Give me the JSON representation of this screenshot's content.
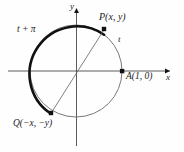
{
  "figure": {
    "background_color": "#fefefe",
    "stroke_color": "#111111",
    "thin_stroke_color": "#6a6a6a",
    "axis_color": "#4a4a4a"
  },
  "axes": {
    "x_label": "x",
    "y_label": "y",
    "origin": {
      "x": 76,
      "y": 71
    },
    "x_range_px": [
      8,
      172
    ],
    "y_range_px": [
      8,
      146
    ]
  },
  "circle": {
    "center": {
      "x": 76,
      "y": 71
    },
    "radius": 46,
    "label": "unit circle"
  },
  "points": [
    {
      "name": "P",
      "label": "P(x, y)",
      "x": 104,
      "y": 29,
      "angle_deg": 56
    },
    {
      "name": "A",
      "label": "A(1, 0)",
      "x": 122,
      "y": 71,
      "angle_deg": 0
    },
    {
      "name": "Q",
      "label": "Q(−x, −y)",
      "x": 51,
      "y": 113,
      "angle_deg": 236
    }
  ],
  "arcs": [
    {
      "name": "bold-arc",
      "label": "t + π",
      "from_point": "P",
      "to_point": "Q",
      "direction": "counterclockwise",
      "emphasis": "bold"
    },
    {
      "name": "thin-arc",
      "label": "t",
      "from_point": "A",
      "to_point": "P",
      "direction": "counterclockwise",
      "emphasis": "thin"
    }
  ],
  "arc_labels": {
    "t": "t",
    "t_plus_pi": "t + π"
  },
  "chord": {
    "name": "PQ-diameter",
    "from": "P",
    "to": "Q"
  }
}
